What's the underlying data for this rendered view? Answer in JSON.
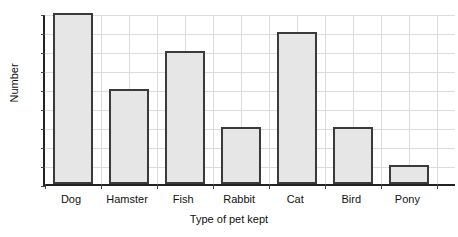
{
  "chart_data": {
    "type": "bar",
    "title": "",
    "xlabel": "Type of pet kept",
    "ylabel": "Number",
    "categories": [
      "Dog",
      "Hamster",
      "Fish",
      "Rabbit",
      "Cat",
      "Bird",
      "Pony"
    ],
    "values": [
      9,
      5,
      7,
      3,
      8,
      3,
      1
    ],
    "yticks": [
      0,
      1,
      2,
      3,
      4,
      5,
      6,
      7,
      8,
      9
    ],
    "ylim": [
      0,
      9
    ],
    "grid": true,
    "legend": null,
    "colors": {
      "bar_fill": "#e6e6e6",
      "bar_stroke": "#3a3a3a",
      "axis": "#222222",
      "grid": "#dcdcdc",
      "text": "#111111",
      "background": "#ffffff"
    }
  }
}
